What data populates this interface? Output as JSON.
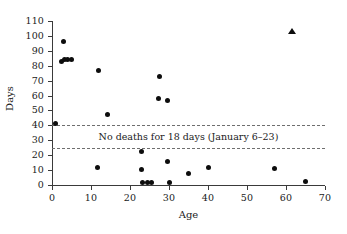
{
  "chart_data": {
    "type": "scatter",
    "title": "",
    "xlabel": "Age",
    "ylabel": "Days",
    "xlim": [
      0,
      70
    ],
    "ylim": [
      0,
      110
    ],
    "grid": false,
    "legend": "none",
    "xticks": [
      0,
      10,
      20,
      30,
      40,
      50,
      60,
      70
    ],
    "yticks": [
      0,
      10,
      20,
      30,
      40,
      50,
      60,
      70,
      80,
      90,
      100,
      110
    ],
    "series": [
      {
        "name": "deaths",
        "marker": "circle",
        "color": "#0d0d0d",
        "points": [
          {
            "x": 1.0,
            "y": 41.5
          },
          {
            "x": 2.5,
            "y": 83.0
          },
          {
            "x": 3.0,
            "y": 96.0
          },
          {
            "x": 3.2,
            "y": 84.0
          },
          {
            "x": 4.0,
            "y": 84.5
          },
          {
            "x": 5.0,
            "y": 84.5
          },
          {
            "x": 11.7,
            "y": 12.0
          },
          {
            "x": 11.8,
            "y": 77.0
          },
          {
            "x": 14.3,
            "y": 47.5
          },
          {
            "x": 23.0,
            "y": 22.5
          },
          {
            "x": 23.0,
            "y": 10.5
          },
          {
            "x": 23.3,
            "y": 1.5
          },
          {
            "x": 24.5,
            "y": 1.5
          },
          {
            "x": 25.5,
            "y": 1.5
          },
          {
            "x": 27.3,
            "y": 58.0
          },
          {
            "x": 27.5,
            "y": 73.0
          },
          {
            "x": 29.5,
            "y": 57.0
          },
          {
            "x": 29.5,
            "y": 15.5
          },
          {
            "x": 30.0,
            "y": 1.5
          },
          {
            "x": 35.0,
            "y": 7.5
          },
          {
            "x": 40.0,
            "y": 12.0
          },
          {
            "x": 57.0,
            "y": 11.0
          },
          {
            "x": 65.0,
            "y": 2.5
          }
        ]
      },
      {
        "name": "outlier",
        "marker": "triangle",
        "color": "#0d0d0d",
        "points": [
          {
            "x": 61.5,
            "y": 103.0
          }
        ]
      }
    ],
    "annotations": [
      {
        "text": "No deaths for 18 days (January 6–23)",
        "y": 32.5
      }
    ],
    "reference_lines": [
      {
        "y": 40.0,
        "style": "dashed"
      },
      {
        "y": 25.0,
        "style": "dashed"
      }
    ]
  }
}
